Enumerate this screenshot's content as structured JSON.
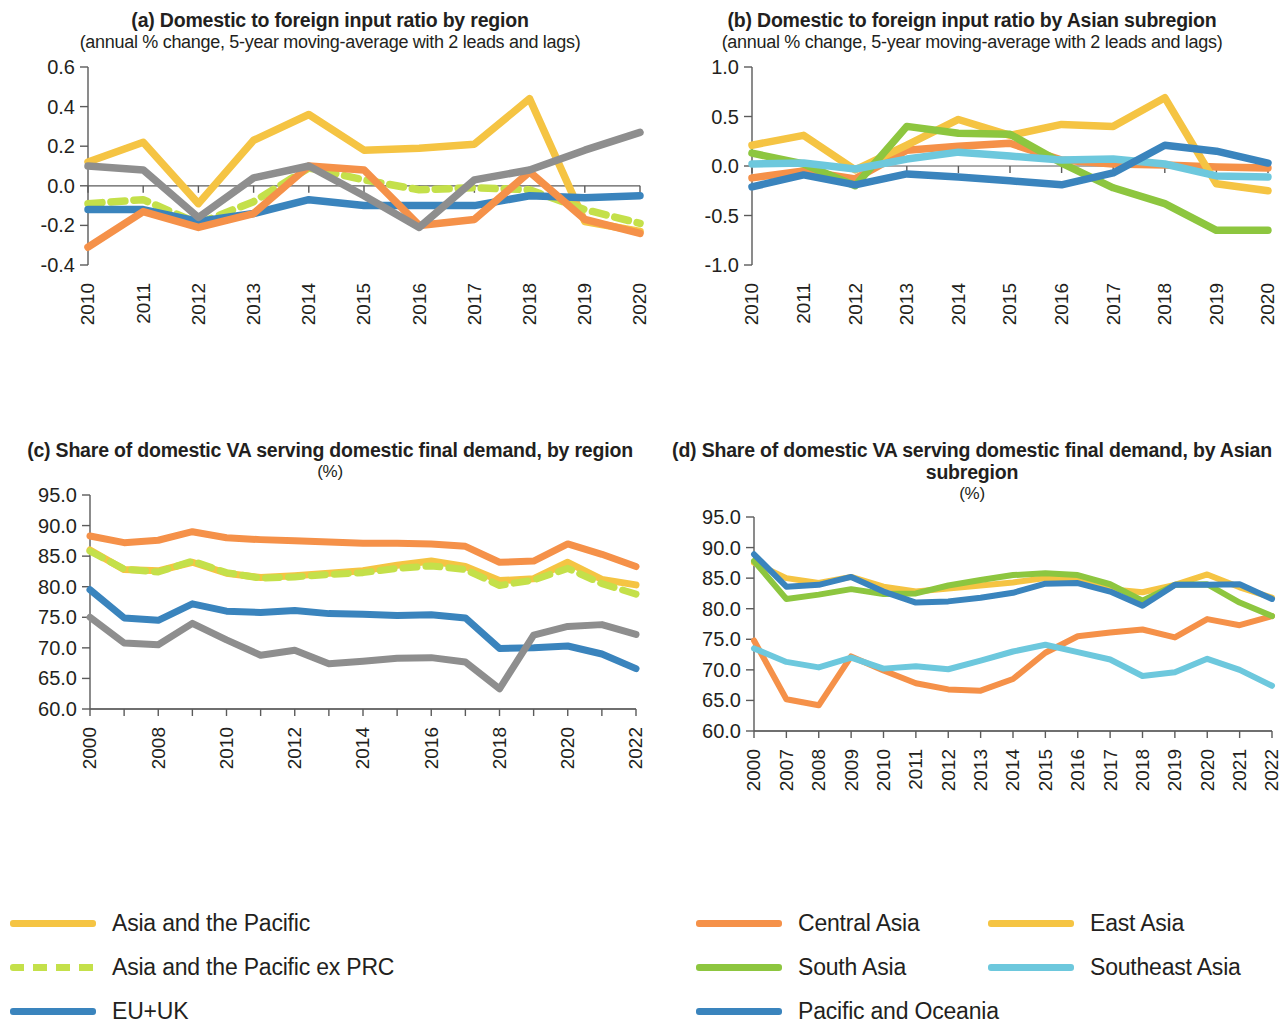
{
  "colors": {
    "asia_pacific": "#F5C443",
    "asia_pacific_ex_prc": "#C4E04A",
    "eu_uk": "#3A84BD",
    "north_america": "#F59149",
    "row": "#8E8E8E",
    "central_asia": "#F59149",
    "east_asia": "#F5C443",
    "south_asia": "#8DC63F",
    "southeast_asia": "#6DC8DD",
    "pacific_oceania": "#3A84BD",
    "axis": "#5B5B5B",
    "text": "#231F20"
  },
  "legend_left": {
    "items": [
      {
        "label": "Asia and the Pacific",
        "color_key": "asia_pacific",
        "dashed": false
      },
      {
        "label": "Asia and the Pacific ex PRC",
        "color_key": "asia_pacific_ex_prc",
        "dashed": true
      },
      {
        "label": "EU+UK",
        "color_key": "eu_uk",
        "dashed": false
      },
      {
        "label": "North America",
        "color_key": "north_america",
        "dashed": false
      },
      {
        "label": "ROW",
        "color_key": "row",
        "dashed": false
      }
    ]
  },
  "legend_right": {
    "items": [
      {
        "label": "Central Asia",
        "color_key": "central_asia",
        "dashed": false
      },
      {
        "label": "East Asia",
        "color_key": "east_asia",
        "dashed": false
      },
      {
        "label": "South Asia",
        "color_key": "south_asia",
        "dashed": false
      },
      {
        "label": "Southeast Asia",
        "color_key": "southeast_asia",
        "dashed": false
      },
      {
        "label": "Pacific and Oceania",
        "color_key": "pacific_oceania",
        "dashed": false
      }
    ]
  },
  "chart_data": [
    {
      "id": "panel_a",
      "type": "line",
      "title": "(a) Domestic to foreign input ratio by region",
      "subtitle": "(annual % change, 5-year moving-average with 2 leads and lags)",
      "subtitle2": "",
      "xlabel": "",
      "ylabel": "",
      "ylim": [
        -0.4,
        0.6
      ],
      "yticks": [
        -0.4,
        -0.2,
        0.0,
        0.2,
        0.4,
        0.6
      ],
      "ytick_labels": [
        "-0.4",
        "-0.2",
        "0.0",
        "0.2",
        "0.4",
        "0.6"
      ],
      "grid": false,
      "zero_line": 0.0,
      "legend_position": "below-figure",
      "categories": [
        "2010",
        "2011",
        "2012",
        "2013",
        "2014",
        "2015",
        "2016",
        "2017",
        "2018",
        "2019",
        "2020"
      ],
      "xtick_labels": [
        "2010",
        "2011",
        "2012",
        "2013",
        "2014",
        "2015",
        "2016",
        "2017",
        "2018",
        "2019",
        "2020"
      ],
      "series": [
        {
          "name": "Asia and the Pacific",
          "color_key": "asia_pacific",
          "dashed": false,
          "values": [
            0.12,
            0.22,
            -0.09,
            0.23,
            0.36,
            0.18,
            0.19,
            0.21,
            0.44,
            -0.18,
            -0.23
          ]
        },
        {
          "name": "Asia and the Pacific ex PRC",
          "color_key": "asia_pacific_ex_prc",
          "dashed": true,
          "values": [
            -0.09,
            -0.07,
            -0.19,
            -0.08,
            0.09,
            0.03,
            -0.02,
            -0.01,
            -0.02,
            -0.12,
            -0.19
          ]
        },
        {
          "name": "EU+UK",
          "color_key": "eu_uk",
          "dashed": false,
          "values": [
            -0.12,
            -0.12,
            -0.18,
            -0.14,
            -0.07,
            -0.1,
            -0.1,
            -0.1,
            -0.05,
            -0.06,
            -0.05
          ]
        },
        {
          "name": "North America",
          "color_key": "north_america",
          "dashed": false,
          "values": [
            -0.31,
            -0.13,
            -0.21,
            -0.14,
            0.1,
            0.08,
            -0.2,
            -0.17,
            0.07,
            -0.17,
            -0.24
          ]
        },
        {
          "name": "ROW",
          "color_key": "row",
          "dashed": false,
          "values": [
            0.1,
            0.08,
            -0.16,
            0.04,
            0.1,
            -0.05,
            -0.21,
            0.03,
            0.08,
            0.18,
            0.27
          ]
        }
      ]
    },
    {
      "id": "panel_b",
      "type": "line",
      "title": "(b) Domestic to foreign input ratio by Asian subregion",
      "subtitle": "(annual % change, 5-year moving-average with 2 leads and lags)",
      "subtitle2": "",
      "xlabel": "",
      "ylabel": "",
      "ylim": [
        -1.0,
        1.0
      ],
      "yticks": [
        -1.0,
        -0.5,
        0.0,
        0.5,
        1.0
      ],
      "ytick_labels": [
        "-1.0",
        "-0.5",
        "0.0",
        "0.5",
        "1.0"
      ],
      "grid": false,
      "zero_line": 0.0,
      "legend_position": "below-figure",
      "categories": [
        "2010",
        "2011",
        "2012",
        "2013",
        "2014",
        "2015",
        "2016",
        "2017",
        "2018",
        "2019",
        "2020"
      ],
      "xtick_labels": [
        "2010",
        "2011",
        "2012",
        "2013",
        "2014",
        "2015",
        "2016",
        "2017",
        "2018",
        "2019",
        "2020"
      ],
      "series": [
        {
          "name": "Central Asia",
          "color_key": "central_asia",
          "dashed": false,
          "values": [
            -0.12,
            -0.05,
            -0.13,
            0.16,
            0.2,
            0.23,
            0.06,
            0.02,
            0.01,
            -0.01,
            -0.02
          ]
        },
        {
          "name": "East Asia",
          "color_key": "east_asia",
          "dashed": false,
          "values": [
            0.21,
            0.31,
            -0.04,
            0.21,
            0.47,
            0.31,
            0.42,
            0.4,
            0.69,
            -0.18,
            -0.25
          ]
        },
        {
          "name": "South Asia",
          "color_key": "south_asia",
          "dashed": false,
          "values": [
            0.13,
            0.02,
            -0.2,
            0.4,
            0.33,
            0.32,
            0.03,
            -0.22,
            -0.38,
            -0.65,
            -0.65
          ]
        },
        {
          "name": "Southeast Asia",
          "color_key": "southeast_asia",
          "dashed": false,
          "values": [
            0.02,
            0.03,
            -0.03,
            0.07,
            0.14,
            0.1,
            0.06,
            0.07,
            0.02,
            -0.1,
            -0.11
          ]
        },
        {
          "name": "Pacific and Oceania",
          "color_key": "pacific_oceania",
          "dashed": false,
          "values": [
            -0.21,
            -0.09,
            -0.19,
            -0.08,
            -0.11,
            -0.15,
            -0.19,
            -0.07,
            0.21,
            0.15,
            0.03
          ]
        }
      ]
    },
    {
      "id": "panel_c",
      "type": "line",
      "title": "(c) Share of domestic VA serving domestic final demand, by region",
      "subtitle": "(%)",
      "subtitle2": "",
      "xlabel": "",
      "ylabel": "",
      "ylim": [
        60.0,
        95.0
      ],
      "yticks": [
        60.0,
        65.0,
        70.0,
        75.0,
        80.0,
        85.0,
        90.0,
        95.0
      ],
      "ytick_labels": [
        "60.0",
        "65.0",
        "70.0",
        "75.0",
        "80.0",
        "85.0",
        "90.0",
        "95.0"
      ],
      "grid": false,
      "legend_position": "below-figure",
      "categories": [
        "2000",
        "2007",
        "2008",
        "2009",
        "2010",
        "2011",
        "2012",
        "2013",
        "2014",
        "2015",
        "2016",
        "2017",
        "2018",
        "2019",
        "2020",
        "2021",
        "2022"
      ],
      "xtick_labels": [
        "2000",
        "",
        "2008",
        "",
        "2010",
        "",
        "2012",
        "",
        "2014",
        "",
        "2016",
        "",
        "2018",
        "",
        "2020",
        "",
        "2022"
      ],
      "series": [
        {
          "name": "Asia and the Pacific",
          "color_key": "asia_pacific",
          "dashed": false,
          "values": [
            86.0,
            82.8,
            82.6,
            84.0,
            82.2,
            81.5,
            81.8,
            82.2,
            82.6,
            83.5,
            84.2,
            83.3,
            81.0,
            81.3,
            84.0,
            81.2,
            80.3
          ]
        },
        {
          "name": "Asia and the Pacific ex PRC",
          "color_key": "asia_pacific_ex_prc",
          "dashed": true,
          "values": [
            85.8,
            82.9,
            82.4,
            84.2,
            82.3,
            81.4,
            81.6,
            82.0,
            82.3,
            83.0,
            83.4,
            82.8,
            80.2,
            81.1,
            83.0,
            80.5,
            78.8
          ]
        },
        {
          "name": "EU+UK",
          "color_key": "eu_uk",
          "dashed": false,
          "values": [
            79.5,
            74.9,
            74.5,
            77.2,
            76.0,
            75.8,
            76.1,
            75.6,
            75.5,
            75.3,
            75.4,
            74.9,
            69.9,
            70.0,
            70.3,
            69.0,
            66.6
          ]
        },
        {
          "name": "North America",
          "color_key": "north_america",
          "dashed": false,
          "values": [
            88.3,
            87.2,
            87.6,
            89.0,
            88.0,
            87.7,
            87.5,
            87.3,
            87.1,
            87.1,
            87.0,
            86.6,
            84.0,
            84.2,
            87.0,
            85.3,
            83.3
          ]
        },
        {
          "name": "ROW",
          "color_key": "row",
          "dashed": false,
          "values": [
            75.0,
            70.8,
            70.5,
            74.0,
            71.3,
            68.8,
            69.6,
            67.4,
            67.8,
            68.3,
            68.4,
            67.7,
            63.3,
            72.1,
            73.5,
            73.8,
            72.2
          ]
        }
      ]
    },
    {
      "id": "panel_d",
      "type": "line",
      "title": "(d) Share of domestic VA serving domestic final demand, by Asian subregion",
      "subtitle": "(%)",
      "subtitle2": "",
      "xlabel": "",
      "ylabel": "",
      "ylim": [
        60.0,
        95.0
      ],
      "yticks": [
        60.0,
        65.0,
        70.0,
        75.0,
        80.0,
        85.0,
        90.0,
        95.0
      ],
      "ytick_labels": [
        "60.0",
        "65.0",
        "70.0",
        "75.0",
        "80.0",
        "85.0",
        "90.0",
        "95.0"
      ],
      "grid": false,
      "legend_position": "below-figure",
      "categories": [
        "2000",
        "2007",
        "2008",
        "2009",
        "2010",
        "2011",
        "2012",
        "2013",
        "2014",
        "2015",
        "2016",
        "2017",
        "2018",
        "2019",
        "2020",
        "2021",
        "2022"
      ],
      "xtick_labels": [
        "2000",
        "2007",
        "2008",
        "2009",
        "2010",
        "2011",
        "2012",
        "2013",
        "2014",
        "2015",
        "2016",
        "2017",
        "2018",
        "2019",
        "2020",
        "2021",
        "2022"
      ],
      "series": [
        {
          "name": "Central Asia",
          "color_key": "central_asia",
          "dashed": false,
          "values": [
            74.8,
            65.2,
            64.2,
            72.2,
            69.9,
            67.8,
            66.8,
            66.6,
            68.5,
            72.8,
            75.5,
            76.1,
            76.6,
            75.3,
            78.3,
            77.3,
            78.8
          ]
        },
        {
          "name": "East Asia",
          "color_key": "east_asia",
          "dashed": false,
          "values": [
            87.5,
            85.0,
            84.2,
            85.2,
            83.6,
            82.8,
            83.3,
            83.8,
            84.3,
            85.0,
            84.8,
            83.2,
            82.7,
            83.9,
            85.6,
            83.5,
            81.8
          ]
        },
        {
          "name": "South Asia",
          "color_key": "south_asia",
          "dashed": false,
          "values": [
            87.8,
            81.6,
            82.3,
            83.2,
            82.4,
            82.5,
            83.8,
            84.7,
            85.5,
            85.8,
            85.5,
            84.0,
            81.3,
            83.9,
            84.0,
            81.0,
            78.8
          ]
        },
        {
          "name": "Southeast Asia",
          "color_key": "southeast_asia",
          "dashed": false,
          "values": [
            73.5,
            71.3,
            70.4,
            72.0,
            70.2,
            70.6,
            70.1,
            71.5,
            73.0,
            74.1,
            72.9,
            71.7,
            69.0,
            69.6,
            71.8,
            70.0,
            67.4
          ]
        },
        {
          "name": "Pacific and Oceania",
          "color_key": "pacific_oceania",
          "dashed": false,
          "values": [
            88.9,
            83.6,
            83.9,
            85.2,
            82.8,
            81.0,
            81.2,
            81.8,
            82.6,
            84.1,
            84.2,
            82.8,
            80.5,
            83.9,
            83.9,
            84.0,
            81.6
          ]
        }
      ]
    }
  ]
}
